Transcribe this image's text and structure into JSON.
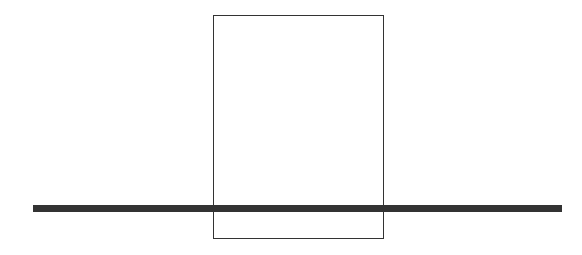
{
  "diagram": {
    "rectangle": {
      "x": 213,
      "y": 15,
      "width": 171,
      "height": 224,
      "stroke": "#333333",
      "stroke_width": 1
    },
    "bar": {
      "x": 33,
      "y": 205,
      "width": 529,
      "height": 7,
      "fill": "#333333"
    }
  }
}
